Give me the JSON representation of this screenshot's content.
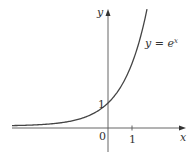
{
  "chart_data": {
    "type": "line",
    "title": "",
    "function_label": "y = e^x",
    "function_label_base": "y = e",
    "function_label_exp": "x",
    "xlabel": "x",
    "ylabel": "y",
    "x_ticks": [
      {
        "value": 0,
        "label": "0"
      },
      {
        "value": 1,
        "label": "1"
      }
    ],
    "y_ticks": [
      {
        "value": 1,
        "label": "1"
      }
    ],
    "xlim": [
      -4,
      3.2
    ],
    "ylim": [
      -1,
      5.1
    ],
    "grid": false,
    "legend": "none",
    "series": [
      {
        "name": "y = e^x",
        "x": [
          -4,
          -3,
          -2,
          -1.5,
          -1,
          -0.5,
          0,
          0.5,
          1,
          1.25,
          1.5,
          1.61
        ],
        "y": [
          0.018,
          0.05,
          0.135,
          0.223,
          0.368,
          0.607,
          1,
          1.649,
          2.718,
          3.49,
          4.48,
          5.0
        ]
      }
    ],
    "annotations": [
      {
        "text": "1",
        "at": [
          0,
          1
        ],
        "note": "y-intercept point"
      }
    ]
  },
  "colors": {
    "axis": "#555555",
    "curve": "#444444",
    "text": "#333333"
  }
}
